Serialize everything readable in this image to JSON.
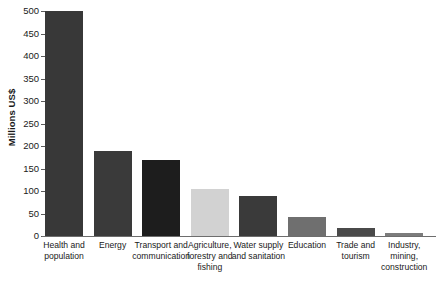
{
  "chart_data": {
    "type": "bar",
    "title": "",
    "subtitle": "",
    "xlabel": "",
    "ylabel": "Millions US$",
    "ylim": [
      0,
      500
    ],
    "yticks": [
      0,
      50,
      100,
      150,
      200,
      250,
      300,
      350,
      400,
      450,
      500
    ],
    "grid": false,
    "legend": "none",
    "categories": [
      "Health and population",
      "Energy",
      "Transport and communication",
      "Agriculture, forestry and fishing",
      "Water supply and sanitation",
      "Education",
      "Trade and tourism",
      "Industry, mining, construction"
    ],
    "category_lines": [
      [
        "Health and",
        "population"
      ],
      [
        "Energy"
      ],
      [
        "Transport and",
        "communication"
      ],
      [
        "Agriculture,",
        "forestry and",
        "fishing"
      ],
      [
        "Water supply",
        "and sanitation"
      ],
      [
        "Education"
      ],
      [
        "Trade and",
        "tourism"
      ],
      [
        "Industry, mining,",
        "construction"
      ]
    ],
    "values": [
      500,
      190,
      168,
      105,
      88,
      42,
      18,
      7
    ],
    "bar_colors": [
      "#383838",
      "#3a3a3a",
      "#1d1d1d",
      "#d2d2d2",
      "#3a3a3a",
      "#6f6f6f",
      "#4a4a4a",
      "#7c7c7c"
    ]
  },
  "axis": {
    "tick_labels": [
      "500",
      "450",
      "400",
      "350",
      "300",
      "250",
      "200",
      "150",
      "100",
      "50",
      "0"
    ]
  }
}
